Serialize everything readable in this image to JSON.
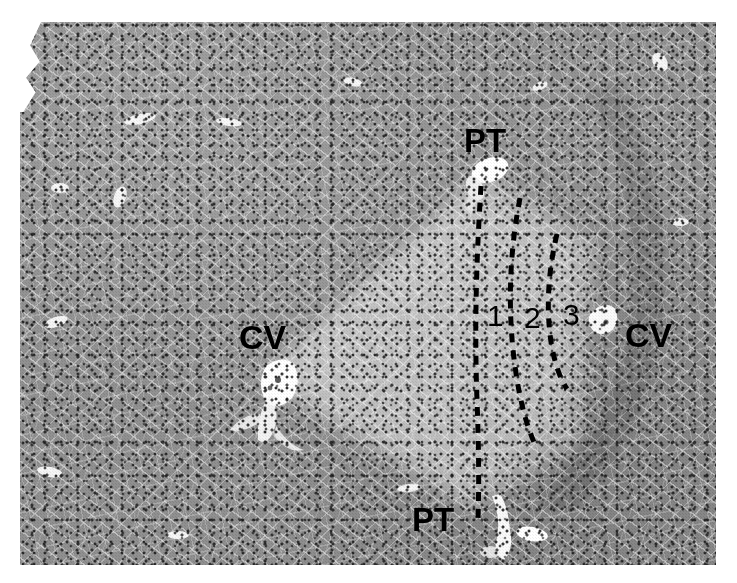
{
  "figure": {
    "kind": "histology-micrograph",
    "stain_tone": "grayscale-brightfield"
  },
  "colors": {
    "parenchyma": "#8d8d8d",
    "acinus_pale": "#a6a6a6",
    "nucleus": "#262626",
    "sinusoid": "#f2f2f2",
    "vessel_lumen": "#ffffff",
    "annotation": "#000000",
    "page": "#ffffff"
  },
  "labels": {
    "portal_tract_top": "PT",
    "portal_tract_bottom": "PT",
    "central_vein_left": "CV",
    "central_vein_right": "CV",
    "zone_1": "1",
    "zone_2": "2",
    "zone_3": "3"
  },
  "zone_boundaries": [
    {
      "name": "boundary-a",
      "style": "dashed"
    },
    {
      "name": "boundary-b",
      "style": "dashed"
    },
    {
      "name": "boundary-c",
      "style": "dashed"
    }
  ],
  "structures": [
    {
      "name": "portal-tract-upper",
      "marker": "PT"
    },
    {
      "name": "portal-tract-lower",
      "marker": "PT"
    },
    {
      "name": "central-vein-left",
      "marker": "CV"
    },
    {
      "name": "central-vein-right",
      "marker": "CV"
    },
    {
      "name": "acinus-region",
      "marker": ""
    }
  ]
}
